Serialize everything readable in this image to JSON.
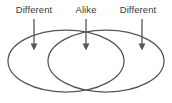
{
  "diagram": {
    "type": "venn-diagram",
    "title": "",
    "background_color": "#ffffff",
    "stroke_color": "#555555",
    "text_color": "#3a3a3a",
    "labels": [
      {
        "id": "left",
        "text": "Different",
        "arrow_x": 34,
        "points_to": "left-circle-only"
      },
      {
        "id": "center",
        "text": "Alike",
        "arrow_x": 86,
        "points_to": "overlap-region"
      },
      {
        "id": "right",
        "text": "Different",
        "arrow_x": 142,
        "points_to": "right-circle-only"
      }
    ],
    "ellipses": [
      {
        "id": "left-ellipse",
        "cx": 66,
        "cy": 61,
        "rx": 58,
        "ry": 31
      },
      {
        "id": "right-ellipse",
        "cx": 106,
        "cy": 61,
        "rx": 58,
        "ry": 31
      }
    ],
    "arrows": {
      "y_start": 19,
      "y_end": 50,
      "head_width": 7,
      "head_height": 9,
      "stroke_width": 1.3
    }
  }
}
